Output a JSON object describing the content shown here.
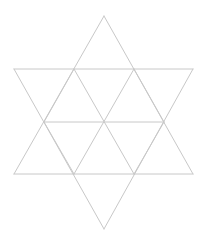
{
  "diagram": {
    "type": "hexagram-triangle-grid",
    "line_color": "#c8c8c8",
    "background": "#ffffff",
    "outer_points": 6,
    "small_triangles": 12
  }
}
